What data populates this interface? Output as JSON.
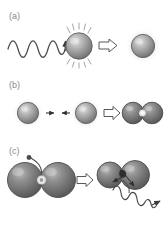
{
  "figure": {
    "type": "scientific-schematic",
    "width": 166,
    "height": 229,
    "background": "#ffffff",
    "panels": [
      {
        "id": "a",
        "label": "(a)",
        "description": "Incident light wave excites a single nanoparticle, which becomes a hot, spiked particle; implication arrow leads to a glowing nanoparticle",
        "elements": {
          "incoming_wave_label": "incident light wave",
          "excited_particle_label": "excited nanoparticle with radiating spikes",
          "implies_arrow": "⇒",
          "result_particle_label": "glowing nanoparticle"
        }
      },
      {
        "id": "b",
        "label": "(b)",
        "description": "Two glowing nanoparticles attract each other (small facing arrows) and form a dimer with a bright hot spot at the junction",
        "elements": {
          "left_particle_label": "nanoparticle",
          "right_particle_label": "nanoparticle",
          "attraction_arrow_left": "→",
          "attraction_arrow_right": "←",
          "implies_arrow": "⇒",
          "dimer_label": "nanoparticle dimer with hot spot"
        }
      },
      {
        "id": "c",
        "label": "(c)",
        "description": "A molecule sits in the dimer hot spot; the dimer then separates (arrows) and emits a scattered light wave",
        "elements": {
          "dimer_label": "nanoparticle dimer",
          "molecule_label": "probe molecule at hot spot",
          "implies_arrow": "⇒",
          "separating_dimer_label": "separating nanoparticle dimer",
          "emitted_wave_label": "emitted / scattered light wave"
        }
      }
    ],
    "colors": {
      "label_gray": "#8a8a8a",
      "stroke_dark": "#3a3a3a",
      "sphere_light_highlight": "#d8d8d8",
      "sphere_mid": "#909090",
      "sphere_dark_edge": "#5a5a5a",
      "sphere_dimer_dark": "#6e6e6e",
      "halo_glow": "#ededed",
      "hotspot_white": "#ffffff",
      "wave_stroke": "#4a4a4a",
      "arrow_fill": "#ffffff",
      "arrow_stroke": "#555555"
    }
  }
}
